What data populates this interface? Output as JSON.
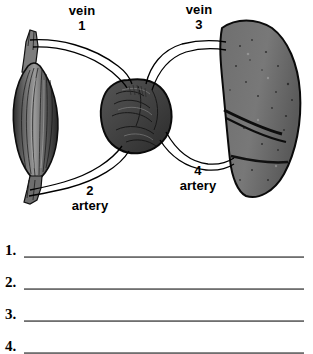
{
  "page": {
    "background_color": "#ffffff",
    "ink_color": "#000000"
  },
  "diagram": {
    "name": "circulatory-pathway-diagram",
    "organs": [
      {
        "id": "skeletal-muscle",
        "label": "skeletal muscle (unlabeled)",
        "position": "left",
        "fill": "#5e5e5e"
      },
      {
        "id": "heart",
        "label": "heart (unlabeled)",
        "position": "center",
        "fill": "#4a4a4a"
      },
      {
        "id": "lung",
        "label": "lung (unlabeled)",
        "position": "right",
        "fill": "#6b6b6b"
      }
    ],
    "vessels": [
      {
        "id": "vessel-1",
        "number": "1",
        "type": "vein",
        "from": "skeletal-muscle",
        "to": "heart"
      },
      {
        "id": "vessel-2",
        "number": "2",
        "type": "artery",
        "from": "heart",
        "to": "skeletal-muscle"
      },
      {
        "id": "vessel-3",
        "number": "3",
        "type": "vein",
        "from": "lung",
        "to": "heart"
      },
      {
        "id": "vessel-4",
        "number": "4",
        "type": "artery",
        "from": "heart",
        "to": "lung"
      }
    ],
    "callouts": {
      "vein_1": {
        "word": "vein",
        "number": "1"
      },
      "vein_3": {
        "word": "vein",
        "number": "3"
      },
      "artery_2": {
        "number": "2",
        "word": "artery"
      },
      "artery_4": {
        "number": "4",
        "word": "artery"
      }
    }
  },
  "answers": {
    "line_color": "#8a8a8a",
    "rows": [
      {
        "number": "1.",
        "value": ""
      },
      {
        "number": "2.",
        "value": ""
      },
      {
        "number": "3.",
        "value": ""
      },
      {
        "number": "4.",
        "value": ""
      }
    ]
  }
}
